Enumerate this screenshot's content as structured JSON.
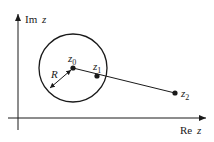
{
  "diagram": {
    "axes": {
      "y_label_main": "Im",
      "y_label_var": "z",
      "x_label_main": "Re",
      "x_label_var": "z"
    },
    "circle": {
      "radius_label": "R"
    },
    "points": [
      {
        "name": "z",
        "sub": "0"
      },
      {
        "name": "z",
        "sub": "1"
      },
      {
        "name": "z",
        "sub": "2"
      }
    ],
    "colors": {
      "stroke": "#1a1a1a",
      "background": "#ffffff"
    }
  }
}
